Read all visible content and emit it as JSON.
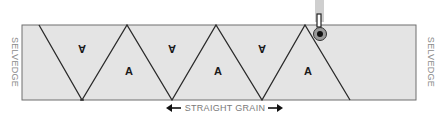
{
  "diagram": {
    "left_edge_label": "SELVEDGE",
    "right_edge_label": "SELVEDGE",
    "grain_label": "STRAIGHT GRAIN",
    "grain_arrows": "both-directions",
    "piece_label": "A",
    "pieces": [
      {
        "label": "A",
        "orientation": "upside-down"
      },
      {
        "label": "A",
        "orientation": "upright"
      },
      {
        "label": "A",
        "orientation": "upside-down"
      },
      {
        "label": "A",
        "orientation": "upright"
      },
      {
        "label": "A",
        "orientation": "upside-down"
      },
      {
        "label": "A",
        "orientation": "upright"
      }
    ],
    "tool": "rotary-cutter",
    "colors": {
      "fabric": "#e4e4e4",
      "cut_line": "#2a2a2a",
      "outline": "#6f6f6f",
      "label_text": "#8a8a8a"
    }
  }
}
